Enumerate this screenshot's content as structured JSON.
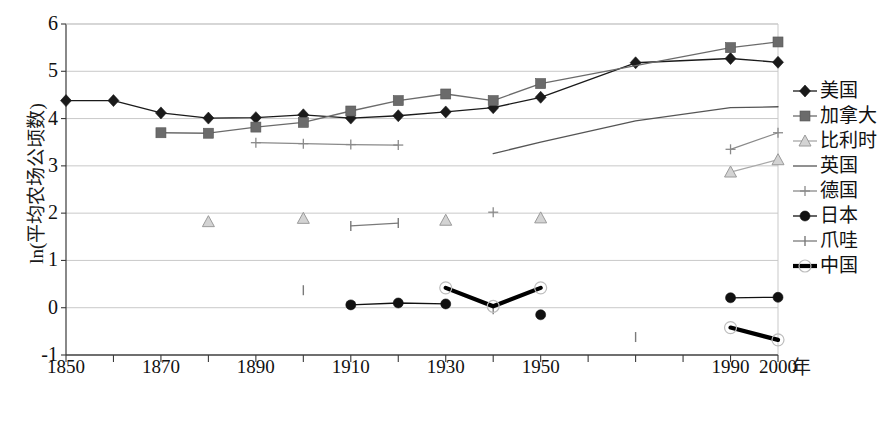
{
  "axes": {
    "ylabel": "ln(平均农场公顷数)",
    "xlabel": "年",
    "yticks": [
      "-1",
      "0",
      "1",
      "2",
      "3",
      "4",
      "5",
      "6"
    ],
    "xticks": [
      "1850",
      "1870",
      "1890",
      "1910",
      "1930",
      "1950",
      "1990",
      "2000"
    ]
  },
  "caption": "",
  "legend": {
    "items": [
      {
        "label": "美国",
        "marker": "diamond",
        "color": "#1a1a1a"
      },
      {
        "label": "加拿大",
        "marker": "square",
        "color": "#6b6b6b"
      },
      {
        "label": "比利时",
        "marker": "triangle",
        "color": "#a8a8a8"
      },
      {
        "label": "英国",
        "marker": "none",
        "color": "#555555"
      },
      {
        "label": "德国",
        "marker": "plus",
        "color": "#8a8a8a"
      },
      {
        "label": "日本",
        "marker": "circle",
        "color": "#111111"
      },
      {
        "label": "爪哇",
        "marker": "bar",
        "color": "#7a7a7a"
      },
      {
        "label": "中国",
        "marker": "thick",
        "color": "#000000"
      }
    ]
  },
  "chart_data": {
    "type": "line",
    "title": "",
    "xlabel": "年",
    "ylabel": "ln(平均农场公顷数)",
    "xlim": [
      1845,
      2005
    ],
    "ylim": [
      -1,
      6
    ],
    "ytick_step": 1,
    "xtick_step_minor": 10,
    "grid": "horizontal",
    "legend_position": "right",
    "x_axis_note": "tick marks every 10 years from 1850 to 2000; labels shown every 20 years plus 1990 and 2000",
    "series": [
      {
        "name": "美国",
        "marker": "diamond",
        "color": "#1a1a1a",
        "points": [
          [
            1850,
            4.38
          ],
          [
            1860,
            4.38
          ],
          [
            1870,
            4.12
          ],
          [
            1880,
            4.01
          ],
          [
            1890,
            4.02
          ],
          [
            1900,
            4.08
          ],
          [
            1910,
            4.01
          ],
          [
            1920,
            4.06
          ],
          [
            1930,
            4.14
          ],
          [
            1940,
            4.23
          ],
          [
            1950,
            4.45
          ],
          [
            1970,
            5.18
          ],
          [
            1990,
            5.27
          ],
          [
            2000,
            5.19
          ]
        ]
      },
      {
        "name": "加拿大",
        "marker": "square",
        "color": "#6b6b6b",
        "points": [
          [
            1870,
            3.7
          ],
          [
            1880,
            3.69
          ],
          [
            1890,
            3.82
          ],
          [
            1900,
            3.92
          ],
          [
            1910,
            4.16
          ],
          [
            1920,
            4.38
          ],
          [
            1930,
            4.52
          ],
          [
            1940,
            4.38
          ],
          [
            1950,
            4.74
          ],
          [
            1990,
            5.5
          ],
          [
            2000,
            5.62
          ]
        ]
      },
      {
        "name": "比利时",
        "marker": "triangle",
        "color": "#a8a8a8",
        "segments": [
          [
            [
              1880,
              1.82
            ]
          ],
          [
            [
              1900,
              1.89
            ]
          ],
          [
            [
              1930,
              1.85
            ]
          ],
          [
            [
              1950,
              1.9
            ]
          ],
          [
            [
              1990,
              2.87
            ],
            [
              2000,
              3.13
            ]
          ]
        ]
      },
      {
        "name": "英国",
        "marker": "none",
        "color": "#555555",
        "segments": [
          [
            [
              1940,
              3.26
            ],
            [
              1950,
              3.5
            ],
            [
              1970,
              3.95
            ],
            [
              1990,
              4.23
            ],
            [
              2000,
              4.25
            ]
          ]
        ]
      },
      {
        "name": "德国",
        "marker": "plus",
        "color": "#8a8a8a",
        "segments": [
          [
            [
              1890,
              3.49
            ],
            [
              1900,
              3.47
            ],
            [
              1910,
              3.45
            ],
            [
              1920,
              3.44
            ]
          ],
          [
            [
              1940,
              2.02
            ]
          ],
          [
            [
              1990,
              3.35
            ],
            [
              2000,
              3.7
            ]
          ]
        ]
      },
      {
        "name": "日本",
        "marker": "circle",
        "color": "#111111",
        "segments": [
          [
            [
              1910,
              0.06
            ],
            [
              1920,
              0.1
            ],
            [
              1930,
              0.08
            ]
          ],
          [
            [
              1950,
              -0.15
            ]
          ],
          [
            [
              1990,
              0.21
            ],
            [
              2000,
              0.22
            ]
          ]
        ]
      },
      {
        "name": "爪哇",
        "marker": "bar",
        "color": "#7a7a7a",
        "segments": [
          [
            [
              1910,
              1.73
            ],
            [
              1920,
              1.79
            ]
          ],
          [
            [
              1900,
              0.37
            ]
          ],
          [
            [
              1940,
              -0.03
            ]
          ],
          [
            [
              1970,
              -0.62
            ]
          ]
        ]
      },
      {
        "name": "中国",
        "marker": "thick",
        "color": "#000000",
        "segments": [
          [
            [
              1930,
              0.42
            ],
            [
              1940,
              0.03
            ],
            [
              1950,
              0.42
            ]
          ],
          [
            [
              1990,
              -0.42
            ],
            [
              2000,
              -0.68
            ]
          ]
        ]
      }
    ]
  }
}
